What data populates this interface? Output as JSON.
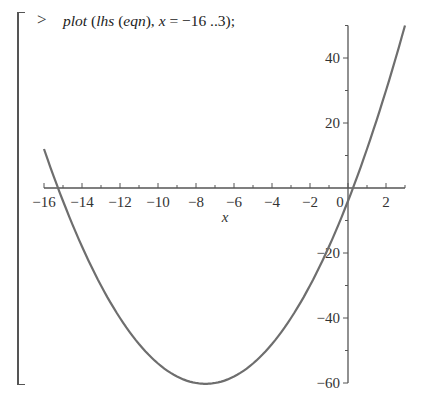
{
  "worksheet": {
    "prompt": ">",
    "command": {
      "fn": "plot",
      "open1": " (",
      "arg_fn": "lhs",
      "open2": " (",
      "arg_inner": "eqn",
      "close_mid": "), ",
      "var": "x",
      "range": " = −16 ..3);"
    }
  },
  "chart_data": {
    "type": "line",
    "title": "",
    "xlabel": "x",
    "ylabel": "",
    "xlim": [
      -16,
      3
    ],
    "ylim": [
      -60,
      50
    ],
    "grid": false,
    "x_ticks": [
      -16,
      -14,
      -12,
      -10,
      -8,
      -6,
      -4,
      -2,
      0,
      2
    ],
    "x_tick_labels": [
      "−16",
      "−14",
      "−12",
      "−10",
      "−8",
      "−6",
      "−4",
      "−2",
      "0",
      "2"
    ],
    "y_ticks": [
      40,
      20,
      -20,
      -40,
      -60
    ],
    "y_tick_labels": [
      "40",
      "20",
      "−20",
      "−40",
      "−60"
    ],
    "series": [
      {
        "name": "lhs(eqn)",
        "color": "#6e6e6e",
        "x": [
          -16,
          -15,
          -14,
          -13,
          -12,
          -11,
          -10,
          -9,
          -8,
          -7.5,
          -7,
          -6,
          -5,
          -4,
          -3,
          -2,
          -1,
          0,
          1,
          2,
          3
        ],
        "y": [
          12,
          -4,
          -18,
          -30,
          -40,
          -48,
          -54,
          -58,
          -60,
          -60.25,
          -60,
          -58,
          -54,
          -48,
          -40,
          -30,
          -18,
          -4,
          12,
          30,
          50
        ]
      }
    ]
  }
}
